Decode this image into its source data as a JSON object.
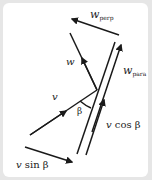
{
  "diagram": {
    "type": "vector-decomposition",
    "stroke_color": "#1a1a1a",
    "background_color": "#e6e6e6",
    "panel_color": "#ffffff",
    "labels": {
      "w_perp": {
        "main": "w",
        "sub": "perp"
      },
      "w": {
        "main": "w"
      },
      "w_para": {
        "main": "w",
        "sub": "para"
      },
      "v": {
        "main": "v"
      },
      "beta": {
        "main": "β"
      },
      "v_cos_beta": {
        "var": "v",
        "text": "cos β"
      },
      "v_sin_beta": {
        "var": "v",
        "text": "sin β"
      }
    },
    "vectors": [
      {
        "name": "w_perp",
        "from": [
          119,
          35
        ],
        "to": [
          72,
          19
        ]
      },
      {
        "name": "w",
        "from": [
          97,
          90
        ],
        "to": [
          70,
          33
        ]
      },
      {
        "name": "w_para",
        "from": [
          92,
          132
        ],
        "to": [
          121,
          45
        ]
      },
      {
        "name": "v",
        "from": [
          30,
          135
        ],
        "to": [
          97,
          90
        ]
      },
      {
        "name": "v_cos_beta",
        "from": [
          86,
          155
        ],
        "to": [
          104,
          100
        ]
      },
      {
        "name": "v_sin_beta",
        "from": [
          25,
          147
        ],
        "to": [
          72,
          162
        ]
      }
    ],
    "reference_line": {
      "from": [
        115,
        42
      ],
      "to": [
        77,
        154
      ]
    },
    "angle": {
      "name": "beta",
      "vertex": [
        97,
        90
      ]
    }
  }
}
